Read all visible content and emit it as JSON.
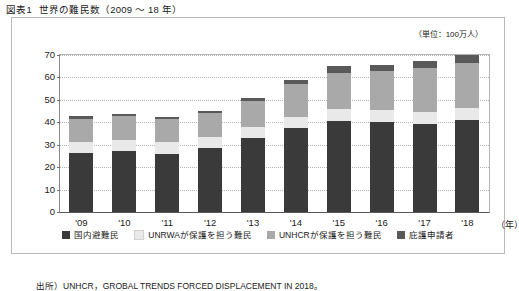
{
  "figure": {
    "number": "図表1",
    "title": "世界の難民数（2009 ～ 18 年）",
    "unit_label": "（単位：100万人）",
    "source_note": "出所）UNHCR，GROBAL TRENDS FORCED DISPLACEMENT IN 2018。",
    "xaxis_unit": "（年）"
  },
  "colors": {
    "idp": "#3a3a3a",
    "unrwa": "#e9e9e9",
    "unhcr": "#a9a9a9",
    "asylum": "#595959",
    "frame": "#b9b9b9",
    "grid": "#b5b5b5"
  },
  "chart_data": {
    "type": "bar",
    "stacked": true,
    "title": "世界の難民数（2009 ～ 18 年）",
    "xlabel": "（年）",
    "ylabel": "",
    "unit": "100万人",
    "ylim": [
      0,
      70
    ],
    "ytick_step": 10,
    "yticks": [
      0,
      10,
      20,
      30,
      40,
      50,
      60,
      70
    ],
    "grid": true,
    "legend_position": "bottom",
    "categories": [
      "'09",
      "'10",
      "'11",
      "'12",
      "'13",
      "'14",
      "'15",
      "'16",
      "'17",
      "'18"
    ],
    "series": [
      {
        "name": "国内避難民",
        "key": "idp",
        "color": "#3a3a3a",
        "values": [
          26.5,
          27.3,
          26.0,
          28.5,
          33.0,
          37.4,
          40.8,
          40.3,
          39.1,
          41.3
        ]
      },
      {
        "name": "UNRWAが保護を担う難民",
        "key": "unrwa",
        "color": "#e9e9e9",
        "values": [
          4.8,
          4.9,
          5.0,
          5.0,
          5.0,
          5.1,
          5.2,
          5.3,
          5.4,
          5.5
        ]
      },
      {
        "name": "UNHCRが保護を担う難民",
        "key": "unhcr",
        "color": "#a9a9a9",
        "values": [
          10.4,
          10.5,
          10.4,
          10.5,
          11.7,
          14.4,
          16.1,
          17.2,
          19.9,
          20.4
        ]
      },
      {
        "name": "庇護申請者",
        "key": "asylum",
        "color": "#595959",
        "values": [
          1.0,
          0.8,
          0.9,
          0.9,
          1.2,
          1.8,
          3.2,
          2.8,
          3.1,
          3.5
        ]
      }
    ],
    "totals": [
      42.7,
      43.5,
      42.3,
      44.9,
      50.9,
      58.7,
      65.3,
      65.6,
      67.5,
      70.7
    ]
  },
  "legend": {
    "items": [
      {
        "label": "国内避難民",
        "color": "#3a3a3a"
      },
      {
        "label": "UNRWAが保護を担う難民",
        "color": "#e9e9e9"
      },
      {
        "label": "UNHCRが保護を担う難民",
        "color": "#a9a9a9"
      },
      {
        "label": "庇護申請者",
        "color": "#595959"
      }
    ]
  }
}
